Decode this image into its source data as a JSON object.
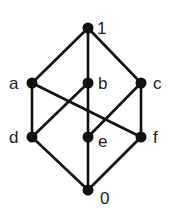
{
  "diagram": {
    "type": "hasse-diagram",
    "colors": {
      "edge": "#111111",
      "node": "#111111",
      "label": "#222222",
      "background": "#ffffff"
    },
    "nodes": [
      {
        "id": "1",
        "label": "1",
        "x": 88,
        "y": 28,
        "lx": 97,
        "ly": 34
      },
      {
        "id": "a",
        "label": "a",
        "x": 32,
        "y": 83,
        "lx": 9,
        "ly": 89
      },
      {
        "id": "b",
        "label": "b",
        "x": 88,
        "y": 83,
        "lx": 98,
        "ly": 89
      },
      {
        "id": "c",
        "label": "c",
        "x": 141,
        "y": 83,
        "lx": 153,
        "ly": 89
      },
      {
        "id": "d",
        "label": "d",
        "x": 32,
        "y": 137,
        "lx": 9,
        "ly": 143
      },
      {
        "id": "e",
        "label": "e",
        "x": 88,
        "y": 137,
        "lx": 98,
        "ly": 147
      },
      {
        "id": "f",
        "label": "f",
        "x": 141,
        "y": 137,
        "lx": 153,
        "ly": 143
      },
      {
        "id": "0",
        "label": "0",
        "x": 88,
        "y": 190,
        "lx": 100,
        "ly": 204
      }
    ],
    "edges": [
      [
        "1",
        "a"
      ],
      [
        "1",
        "b"
      ],
      [
        "1",
        "c"
      ],
      [
        "a",
        "d"
      ],
      [
        "a",
        "f"
      ],
      [
        "b",
        "d"
      ],
      [
        "b",
        "e"
      ],
      [
        "c",
        "e"
      ],
      [
        "c",
        "f"
      ],
      [
        "d",
        "0"
      ],
      [
        "e",
        "0"
      ],
      [
        "f",
        "0"
      ]
    ]
  }
}
